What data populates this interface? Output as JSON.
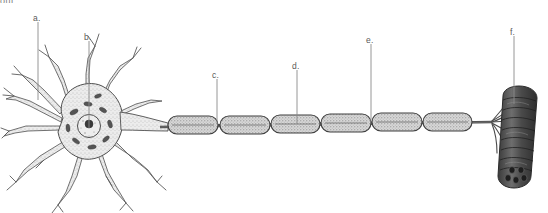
{
  "figure": {
    "title_fragment": "out",
    "background_color": "#ffffff",
    "ink_color": "#4a4a4a",
    "fill_light": "#f2f2f2",
    "fill_myelin": "#cfcfcf",
    "fill_muscle": "#5e5e5e",
    "leader_color": "#8a8a8a",
    "label_color": "#5a5a5a"
  },
  "labels": [
    {
      "id": "a",
      "text": "a.",
      "x": 33,
      "y": 14,
      "leader_x": 38,
      "leader_y1": 22,
      "leader_y2": 100,
      "target": "dendrite"
    },
    {
      "id": "b",
      "text": "b.",
      "x": 84,
      "y": 33,
      "leader_x": 89,
      "leader_y1": 41,
      "leader_y2": 128,
      "target": "nucleus"
    },
    {
      "id": "c",
      "text": "c.",
      "x": 212,
      "y": 71,
      "leader_x": 217,
      "leader_y1": 79,
      "leader_y2": 124,
      "target": "node-of-ranvier"
    },
    {
      "id": "d",
      "text": "d.",
      "x": 292,
      "y": 62,
      "leader_x": 297,
      "leader_y1": 70,
      "leader_y2": 124,
      "target": "myelin-sheath"
    },
    {
      "id": "e",
      "text": "e.",
      "x": 366,
      "y": 36,
      "leader_x": 371,
      "leader_y1": 44,
      "leader_y2": 122,
      "target": "node-of-ranvier"
    },
    {
      "id": "f",
      "text": "f.",
      "x": 510,
      "y": 28,
      "leader_x": 514,
      "leader_y1": 36,
      "leader_y2": 104,
      "target": "muscle-fiber"
    }
  ],
  "structures": {
    "soma": "cell-body",
    "dendrite_count": 11,
    "nucleus": "nucleus-with-nucleolus",
    "nissl_bodies": 9,
    "axon_hillock": "axon-hillock",
    "myelin_segment_count": 6,
    "node_count": 5,
    "terminal_branch_count": 7,
    "target_tissue": "muscle-fiber"
  },
  "myelin_segments": [
    {
      "index": 1,
      "cx": 193,
      "rx": 25
    },
    {
      "index": 2,
      "cx": 245,
      "rx": 25
    },
    {
      "index": 3,
      "cx": 295,
      "rx": 24
    },
    {
      "index": 4,
      "cx": 346,
      "rx": 25
    },
    {
      "index": 5,
      "cx": 397,
      "rx": 25
    },
    {
      "index": 6,
      "cx": 447,
      "rx": 24
    }
  ]
}
